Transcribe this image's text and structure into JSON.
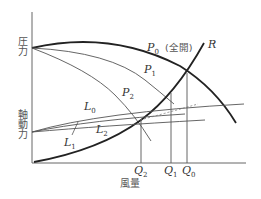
{
  "diagram": {
    "axes": {
      "y_label_top": "圧力",
      "y_label_bottom": "軸動力",
      "x_label": "風量"
    },
    "curves": {
      "P0": {
        "name": "P",
        "sub": "0",
        "note": "(全開)"
      },
      "P1": {
        "name": "P",
        "sub": "1"
      },
      "P2": {
        "name": "P",
        "sub": "2"
      },
      "R": {
        "name": "R"
      },
      "L0": {
        "name": "L",
        "sub": "0"
      },
      "L1": {
        "name": "L",
        "sub": "1"
      },
      "L2": {
        "name": "L",
        "sub": "2"
      }
    },
    "flow_points": [
      {
        "name": "Q",
        "sub": "2"
      },
      {
        "name": "Q",
        "sub": "1"
      },
      {
        "name": "Q",
        "sub": "0"
      }
    ],
    "colors": {
      "thick": "#222222",
      "thin": "#555555",
      "axis": "#666666"
    }
  }
}
